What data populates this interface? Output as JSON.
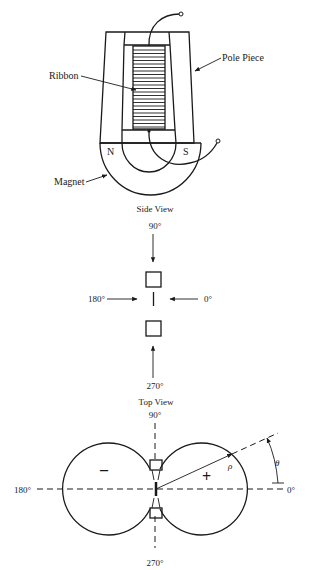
{
  "figure": {
    "labels": {
      "ribbon": "Ribbon",
      "pole_piece": "Pole Piece",
      "magnet": "Magnet",
      "north": "N",
      "south": "S"
    },
    "side_view": {
      "title": "Side View",
      "angle_top": "90°",
      "angle_left": "180°",
      "angle_right": "0°",
      "angle_bottom": "270°"
    },
    "top_view": {
      "title": "Top View",
      "angle_top": "90°",
      "angle_left": "180°",
      "angle_right": "0°",
      "angle_bottom": "270°",
      "negative_lobe": "–",
      "positive_lobe": "+",
      "rho": "ρ",
      "theta": "θ"
    }
  },
  "colors": {
    "ink": "#1a1a1a",
    "background": "#ffffff"
  }
}
